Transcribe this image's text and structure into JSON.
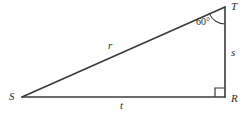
{
  "figure": {
    "stroke_color": "#3a3a3a",
    "text_color": "#2b2b2b",
    "background_color": "#ffffff",
    "vertices": {
      "S": {
        "label": "S",
        "x": 22,
        "y": 97
      },
      "R": {
        "label": "R",
        "x": 225,
        "y": 97
      },
      "T": {
        "label": "T",
        "x": 225,
        "y": 7
      }
    },
    "sides": {
      "hypotenuse": {
        "label": "r",
        "from": "S",
        "to": "T"
      },
      "vertical": {
        "label": "s",
        "from": "T",
        "to": "R"
      },
      "base": {
        "label": "t",
        "from": "S",
        "to": "R"
      }
    },
    "angles": {
      "at_T": {
        "label": "60°",
        "value": 60,
        "unit": "degrees"
      },
      "at_R": {
        "label": "right-angle",
        "value": 90,
        "unit": "degrees",
        "marker": "square"
      }
    }
  }
}
